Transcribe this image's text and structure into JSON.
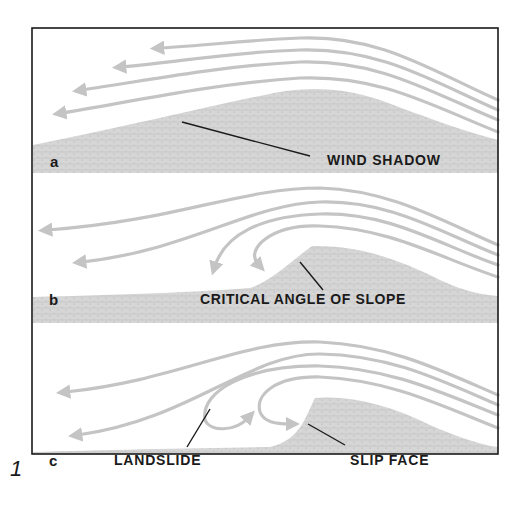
{
  "figure": {
    "number": "1",
    "colors": {
      "frame": "#1a1a1a",
      "wind_arrows": "#c4c4c4",
      "sand": "#d4d4d4",
      "text": "#1a1a1a",
      "background": "#ffffff"
    },
    "panels": [
      {
        "letter": "a",
        "label": "WIND SHADOW"
      },
      {
        "letter": "b",
        "label": "CRITICAL ANGLE OF SLOPE"
      },
      {
        "letter": "c",
        "labels": [
          "LANDSLIDE",
          "SLIP FACE"
        ]
      }
    ]
  }
}
